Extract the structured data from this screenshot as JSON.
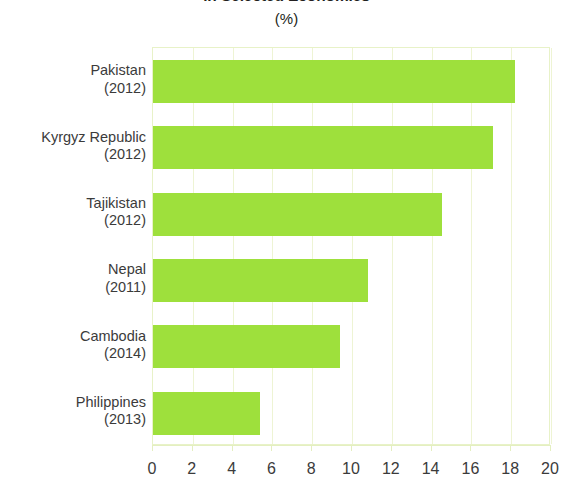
{
  "chart_data": {
    "type": "bar",
    "orientation": "horizontal",
    "title": "in Selected Economies",
    "subtitle": "(%)",
    "xlabel": "",
    "ylabel": "",
    "xlim": [
      0,
      20
    ],
    "xticks": [
      0,
      2,
      4,
      6,
      8,
      10,
      12,
      14,
      16,
      18,
      20
    ],
    "xtick_labels": [
      "0",
      "2",
      "4",
      "6",
      "8",
      "10",
      "12",
      "14",
      "16",
      "18",
      "20"
    ],
    "grid": true,
    "grid_axis": "x",
    "legend": "none",
    "bar_color": "#9ee03c",
    "categories": [
      "Pakistan\n(2012)",
      "Kyrgyz Republic\n(2012)",
      "Tajikistan\n(2012)",
      "Nepal\n(2011)",
      "Cambodia\n(2014)",
      "Philippines\n(2013)"
    ],
    "values": [
      18.2,
      17.1,
      14.5,
      10.8,
      9.4,
      5.4
    ],
    "items": [
      {
        "country": "Pakistan",
        "year": "(2012)",
        "value": 18.2
      },
      {
        "country": "Kyrgyz Republic",
        "year": "(2012)",
        "value": 17.1
      },
      {
        "country": "Tajikistan",
        "year": "(2012)",
        "value": 14.5
      },
      {
        "country": "Nepal",
        "year": "(2011)",
        "value": 10.8
      },
      {
        "country": "Cambodia",
        "year": "(2014)",
        "value": 9.4
      },
      {
        "country": "Philippines",
        "year": "(2013)",
        "value": 5.4
      }
    ]
  }
}
